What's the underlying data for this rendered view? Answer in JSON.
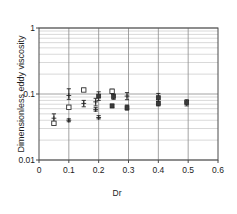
{
  "chart_data": {
    "type": "scatter",
    "title": "",
    "xlabel": "Dr",
    "ylabel": "Dimensionless eddy viscosity",
    "xlim": [
      0,
      0.6
    ],
    "ylim": [
      0.01,
      1
    ],
    "yscale": "log",
    "xscale": "linear",
    "grid": true,
    "legend": "none",
    "xticks": [
      "0",
      "0.1",
      "0.2",
      "0.3",
      "0.4",
      "0.5",
      "0.6"
    ],
    "xtick_values": [
      0,
      0.1,
      0.2,
      0.3,
      0.4,
      0.5,
      0.6
    ],
    "yticks": [
      "1",
      "0.1",
      "0.01"
    ],
    "ytick_values": [
      1,
      0.1,
      0.01
    ],
    "points": [
      {
        "x": 0.05,
        "y": 0.043,
        "yerr_low": 0.036,
        "yerr_high": 0.05,
        "marker": "cross"
      },
      {
        "x": 0.05,
        "y": 0.036,
        "yerr_low": 0.034,
        "yerr_high": 0.038,
        "marker": "open-square"
      },
      {
        "x": 0.1,
        "y": 0.095,
        "yerr_low": 0.083,
        "yerr_high": 0.12,
        "marker": "cross"
      },
      {
        "x": 0.1,
        "y": 0.063,
        "yerr_low": 0.06,
        "yerr_high": 0.067,
        "marker": "open-square"
      },
      {
        "x": 0.1,
        "y": 0.04,
        "yerr_low": 0.038,
        "yerr_high": 0.042,
        "marker": "cross"
      },
      {
        "x": 0.15,
        "y": 0.115,
        "yerr_low": 0.11,
        "yerr_high": 0.122,
        "marker": "open-square"
      },
      {
        "x": 0.15,
        "y": 0.072,
        "yerr_low": 0.064,
        "yerr_high": 0.08,
        "marker": "cross"
      },
      {
        "x": 0.19,
        "y": 0.076,
        "yerr_low": 0.066,
        "yerr_high": 0.086,
        "marker": "cross"
      },
      {
        "x": 0.19,
        "y": 0.058,
        "yerr_low": 0.055,
        "yerr_high": 0.062,
        "marker": "cross"
      },
      {
        "x": 0.2,
        "y": 0.093,
        "yerr_low": 0.08,
        "yerr_high": 0.108,
        "marker": "filled-square"
      },
      {
        "x": 0.2,
        "y": 0.044,
        "yerr_low": 0.042,
        "yerr_high": 0.047,
        "marker": "cross"
      },
      {
        "x": 0.245,
        "y": 0.11,
        "yerr_low": 0.103,
        "yerr_high": 0.118,
        "marker": "open-square"
      },
      {
        "x": 0.245,
        "y": 0.066,
        "yerr_low": 0.062,
        "yerr_high": 0.07,
        "marker": "filled-square"
      },
      {
        "x": 0.25,
        "y": 0.092,
        "yerr_low": 0.083,
        "yerr_high": 0.1,
        "marker": "filled-square"
      },
      {
        "x": 0.295,
        "y": 0.093,
        "yerr_low": 0.082,
        "yerr_high": 0.105,
        "marker": "cross"
      },
      {
        "x": 0.295,
        "y": 0.062,
        "yerr_low": 0.057,
        "yerr_high": 0.068,
        "marker": "filled-square"
      },
      {
        "x": 0.4,
        "y": 0.088,
        "yerr_low": 0.07,
        "yerr_high": 0.102,
        "marker": "filled-square"
      },
      {
        "x": 0.4,
        "y": 0.072,
        "yerr_low": 0.066,
        "yerr_high": 0.078,
        "marker": "filled-square"
      },
      {
        "x": 0.495,
        "y": 0.074,
        "yerr_low": 0.066,
        "yerr_high": 0.082,
        "marker": "filled-square"
      }
    ]
  }
}
